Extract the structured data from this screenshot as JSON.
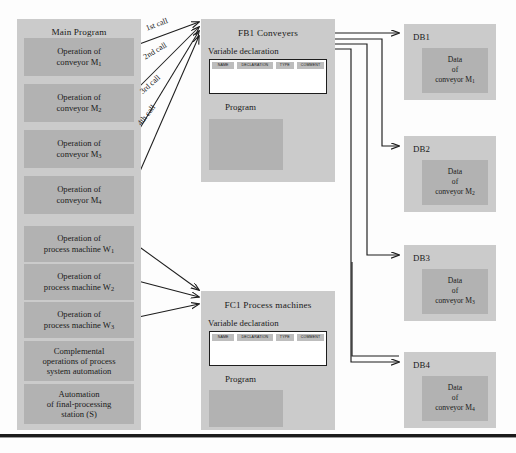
{
  "diagram": {
    "colors": {
      "panel": "#cbcbcb",
      "inner": "#b2b2b2",
      "table_header": "#bdbdbd",
      "line": "#1d1d1d",
      "rule": "#1b1b1b"
    }
  },
  "main_program": {
    "title": "Main Program",
    "items": [
      {
        "line1": "Operation of",
        "line2": "conveyor M",
        "sub": "1"
      },
      {
        "line1": "Operation of",
        "line2": "conveyor M",
        "sub": "2"
      },
      {
        "line1": "Operation of",
        "line2": "conveyor M",
        "sub": "3"
      },
      {
        "line1": "Operation of",
        "line2": "conveyor M",
        "sub": "4"
      },
      {
        "line1": "Operation of",
        "line2": "process machine W",
        "sub": "1"
      },
      {
        "line1": "Operation of",
        "line2": "process machine W",
        "sub": "2"
      },
      {
        "line1": "Operation of",
        "line2": "process machine W",
        "sub": "3"
      },
      {
        "line1": "Complemental",
        "line2": "operations of process",
        "line3": "system automation",
        "sub": ""
      },
      {
        "line1": "Automation",
        "line2": "of final-processing",
        "line3": "station (S)",
        "sub": ""
      }
    ]
  },
  "call_labels": [
    "1st call",
    "2nd call",
    "3rd call",
    "4th call"
  ],
  "blocks": [
    {
      "id": "fb1",
      "title": "FB1  Conveyers",
      "variable_declaration_label": "Variable declaration",
      "table_headers": [
        "NAME",
        "DECLARATION",
        "TYPE",
        "COMMENT"
      ],
      "program_label": "Program"
    },
    {
      "id": "fc1",
      "title": "FC1 Process machines",
      "variable_declaration_label": "Variable declaration",
      "table_headers": [
        "NAME",
        "DECLARATION",
        "TYPE",
        "COMMENT"
      ],
      "program_label": "Program"
    }
  ],
  "data_blocks": [
    {
      "title": "DB1",
      "l1": "Data",
      "l2": "of",
      "l3": "conveyor M",
      "sub": "1"
    },
    {
      "title": "DB2",
      "l1": "Data",
      "l2": "of",
      "l3": "conveyor M",
      "sub": "2"
    },
    {
      "title": "DB3",
      "l1": "Data",
      "l2": "of",
      "l3": "conveyor M",
      "sub": "3"
    },
    {
      "title": "DB4",
      "l1": "Data",
      "l2": "of",
      "l3": "conveyor M",
      "sub": "4"
    }
  ]
}
